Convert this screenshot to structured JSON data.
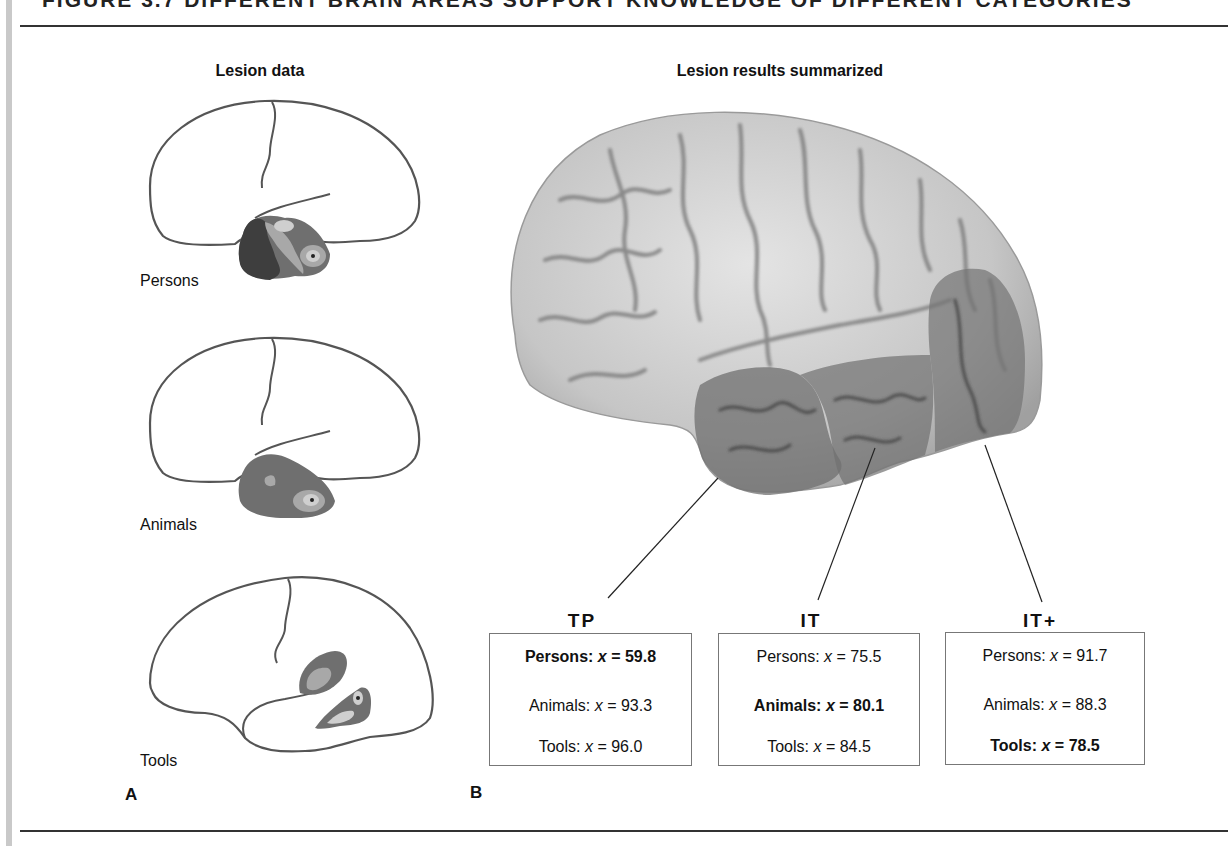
{
  "figure": {
    "title_partial": "FIGURE 3.7  DIFFERENT BRAIN AREAS SUPPORT KNOWLEDGE OF DIFFERENT CATEGORIES",
    "panel_a": {
      "heading": "Lesion data",
      "letter": "A",
      "brains": [
        {
          "label": "Persons"
        },
        {
          "label": "Animals"
        },
        {
          "label": "Tools"
        }
      ]
    },
    "panel_b": {
      "heading": "Lesion results summarized",
      "letter": "B",
      "regions": [
        {
          "label": "TP",
          "scores": [
            {
              "category": "Persons",
              "var": "x",
              "value": "59.8",
              "bold": true
            },
            {
              "category": "Animals",
              "var": "x",
              "value": "93.3",
              "bold": false
            },
            {
              "category": "Tools",
              "var": "x",
              "value": "96.0",
              "bold": false
            }
          ]
        },
        {
          "label": "IT",
          "scores": [
            {
              "category": "Persons",
              "var": "x",
              "value": "75.5",
              "bold": false
            },
            {
              "category": "Animals",
              "var": "x",
              "value": "80.1",
              "bold": true
            },
            {
              "category": "Tools",
              "var": "x",
              "value": "84.5",
              "bold": false
            }
          ]
        },
        {
          "label": "IT+",
          "scores": [
            {
              "category": "Persons",
              "var": "x",
              "value": "91.7",
              "bold": false
            },
            {
              "category": "Animals",
              "var": "x",
              "value": "88.3",
              "bold": false
            },
            {
              "category": "Tools",
              "var": "x",
              "value": "78.5",
              "bold": true
            }
          ]
        }
      ]
    }
  },
  "colors": {
    "outline": "#555555",
    "lesion_dark": "#3e3e3e",
    "lesion_mid": "#6f6f6f",
    "lesion_light": "#a8a8a8",
    "lesion_pale": "#cfcfcf",
    "brain_light": "#d9d9d9",
    "brain_sulci": "#8a8a8a",
    "highlight_region": "#7d7d7d"
  }
}
